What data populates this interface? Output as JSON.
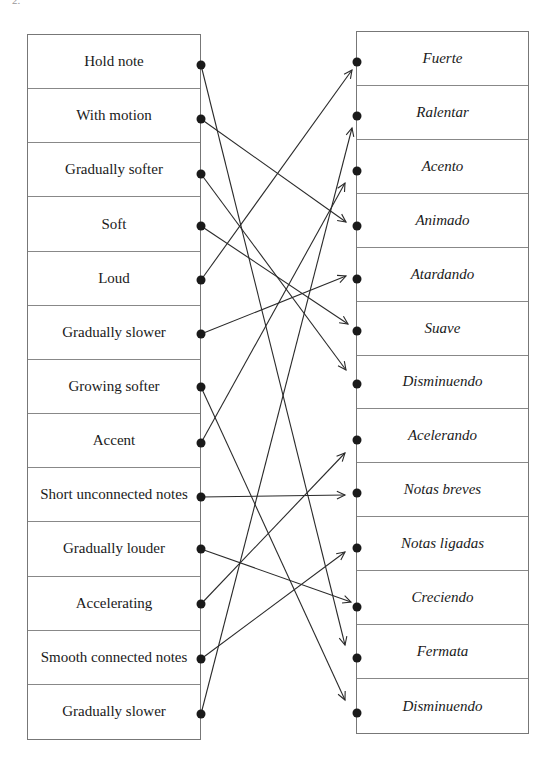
{
  "corner_label": "2.",
  "left_items": [
    {
      "label": "Hold note",
      "dot_y": 65
    },
    {
      "label": "With motion",
      "dot_y": 119
    },
    {
      "label": "Gradually softer",
      "dot_y": 174
    },
    {
      "label": "Soft",
      "dot_y": 226
    },
    {
      "label": "Loud",
      "dot_y": 280
    },
    {
      "label": "Gradually slower",
      "dot_y": 334
    },
    {
      "label": "Growing softer",
      "dot_y": 387
    },
    {
      "label": "Accent",
      "dot_y": 443
    },
    {
      "label": "Short unconnected notes",
      "dot_y": 497
    },
    {
      "label": "Gradually louder",
      "dot_y": 549
    },
    {
      "label": "Accelerating",
      "dot_y": 604
    },
    {
      "label": "Smooth connected notes",
      "dot_y": 659
    },
    {
      "label": "Gradually slower",
      "dot_y": 714
    }
  ],
  "right_items": [
    {
      "label": "Fuerte",
      "dot_y": 62
    },
    {
      "label": "Ralentar",
      "dot_y": 116
    },
    {
      "label": "Acento",
      "dot_y": 171
    },
    {
      "label": "Animado",
      "dot_y": 226
    },
    {
      "label": "Atardando",
      "dot_y": 279
    },
    {
      "label": "Suave",
      "dot_y": 331
    },
    {
      "label": "Disminuendo",
      "dot_y": 384
    },
    {
      "label": "Acelerando",
      "dot_y": 440
    },
    {
      "label": "Notas breves",
      "dot_y": 493
    },
    {
      "label": "Notas ligadas",
      "dot_y": 548
    },
    {
      "label": "Creciendo",
      "dot_y": 607
    },
    {
      "label": "Fermata",
      "dot_y": 658
    },
    {
      "label": "Disminuendo",
      "dot_y": 713
    }
  ],
  "links": [
    {
      "from": 0,
      "to": 11,
      "end": [
        345,
        645
      ]
    },
    {
      "from": 1,
      "to": 3,
      "end": [
        346,
        222
      ]
    },
    {
      "from": 2,
      "to": 6,
      "end": [
        346,
        370
      ]
    },
    {
      "from": 3,
      "to": 5,
      "end": [
        348,
        324
      ]
    },
    {
      "from": 4,
      "to": 0,
      "end": [
        352,
        70
      ]
    },
    {
      "from": 5,
      "to": 4,
      "end": [
        346,
        276
      ]
    },
    {
      "from": 6,
      "to": 12,
      "end": [
        345,
        700
      ]
    },
    {
      "from": 7,
      "to": 2,
      "end": [
        345,
        183
      ]
    },
    {
      "from": 8,
      "to": 8,
      "end": [
        345,
        495
      ]
    },
    {
      "from": 9,
      "to": 10,
      "end": [
        351,
        602
      ]
    },
    {
      "from": 10,
      "to": 7,
      "end": [
        345,
        453
      ]
    },
    {
      "from": 11,
      "to": 9,
      "end": [
        345,
        552
      ]
    },
    {
      "from": 12,
      "to": 1,
      "end": [
        352,
        128
      ]
    }
  ],
  "colors": {
    "line": "#2a2a2a",
    "dot": "#1a1a1a",
    "border": "#777777"
  }
}
